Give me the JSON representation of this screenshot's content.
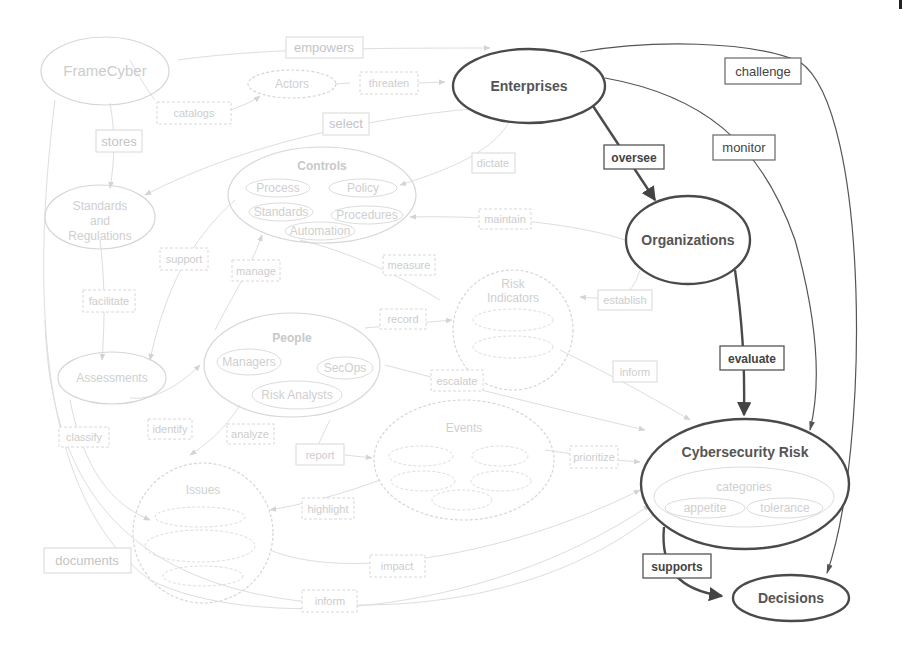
{
  "diagram": {
    "highlighted_nodes": {
      "enterprises": "Enterprises",
      "organizations": "Organizations",
      "cyber_risk": "Cybersecurity Risk",
      "decisions": "Decisions"
    },
    "highlighted_edges": {
      "oversee": "oversee",
      "evaluate": "evaluate",
      "supports": "supports",
      "challenge": "challenge",
      "monitor": "monitor"
    },
    "cyber_risk_sub": {
      "categories": "categories",
      "appetite": "appetite",
      "tolerance": "tolerance"
    },
    "faded_nodes": {
      "framecyber": "FrameCyber",
      "actors": "Actors",
      "standards": [
        "Standards",
        "and",
        "Regulations"
      ],
      "controls": "Controls",
      "controls_items": [
        "Process",
        "Policy",
        "Standards",
        "Procedures",
        "Automation"
      ],
      "assessments": "Assessments",
      "people": "People",
      "people_items": [
        "Managers",
        "SecOps",
        "Risk Analysts"
      ],
      "risk_indicators": [
        "Risk",
        "Indicators"
      ],
      "events": "Events",
      "issues": "Issues"
    },
    "faded_edges": {
      "empowers": "empowers",
      "catalogs": "catalogs",
      "threaten": "threaten",
      "select": "select",
      "stores": "stores",
      "dictate": "dictate",
      "maintain": "maintain",
      "support": "support",
      "manage": "manage",
      "measure": "measure",
      "facilitate": "facilitate",
      "establish": "establish",
      "record": "record",
      "escalate": "escalate",
      "inform": "inform",
      "identify": "identify",
      "analyze": "analyze",
      "classify": "classify",
      "report": "report",
      "highlight": "highlight",
      "documents": "documents",
      "impact": "impact",
      "prioritize": "prioritize",
      "inform2": "inform",
      "measure2": "measure"
    }
  }
}
